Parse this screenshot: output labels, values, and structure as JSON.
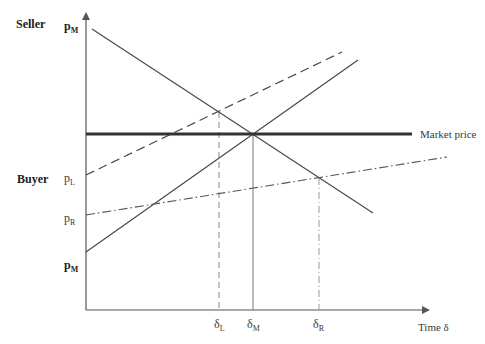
{
  "diagram": {
    "side_labels": {
      "seller": "Seller",
      "buyer": "Buyer"
    },
    "y_ticks": {
      "pM_top": {
        "base": "p",
        "sub": "M"
      },
      "pL": {
        "base": "p",
        "sub": "L"
      },
      "pR": {
        "base": "p",
        "sub": "R"
      },
      "pM_bottom": {
        "base": "p",
        "sub": "M"
      }
    },
    "x_ticks": {
      "dL": {
        "base": "δ",
        "sub": "L"
      },
      "dM": {
        "base": "δ",
        "sub": "M"
      },
      "dR": {
        "base": "δ",
        "sub": "R"
      }
    },
    "x_axis_label": "Time δ",
    "market_price_label": "Market price",
    "colors": {
      "line": "#4a4a4a",
      "market": "#333333",
      "axis": "#555555",
      "guide": "#888888"
    },
    "lines": [
      {
        "name": "seller-reservation-line",
        "style": "solid",
        "from": [
          92,
          29
        ],
        "to": [
          373,
          213
        ]
      },
      {
        "name": "buyer-high-line",
        "style": "solid",
        "from": [
          86,
          252
        ],
        "to": [
          358,
          60
        ]
      },
      {
        "name": "buyer-left-line",
        "style": "dashed",
        "from": [
          86,
          175
        ],
        "to": [
          342,
          52
        ]
      },
      {
        "name": "buyer-right-line",
        "style": "dash-dot",
        "from": [
          86,
          215
        ],
        "to": [
          447,
          157
        ]
      },
      {
        "name": "market-price-line",
        "style": "thick",
        "from": [
          86,
          134
        ],
        "to": [
          412,
          134
        ]
      }
    ],
    "intersections": {
      "delta_L": [
        219,
        112
      ],
      "delta_M": [
        253,
        134
      ],
      "delta_R": [
        319,
        178
      ]
    }
  }
}
